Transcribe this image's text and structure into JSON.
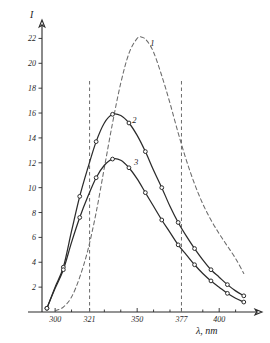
{
  "chart_data": {
    "type": "line",
    "title": "",
    "subtitle": "",
    "xlabel": "λ, nm",
    "ylabel": "I",
    "xlim": [
      292,
      420
    ],
    "ylim": [
      0,
      23
    ],
    "grid": false,
    "legend_position": "inline-curve-labels",
    "x_ticks": [
      300,
      321,
      350,
      377,
      400
    ],
    "x_tick_labels": [
      "300",
      "321",
      "350",
      "377",
      "400"
    ],
    "x_minor_ticks": [
      310,
      330,
      340,
      360,
      370,
      390,
      410
    ],
    "y_ticks": [
      2,
      4,
      6,
      8,
      10,
      12,
      14,
      16,
      18,
      20,
      22
    ],
    "y_tick_labels": [
      "2",
      "4",
      "6",
      "8",
      "10",
      "12",
      "14",
      "16",
      "18",
      "20",
      "22"
    ],
    "annotations": [
      {
        "text": "1",
        "x": 358,
        "y": 21.4,
        "curve": "1"
      },
      {
        "text": "2",
        "x": 347,
        "y": 15.2,
        "curve": "2"
      },
      {
        "text": "3",
        "x": 348,
        "y": 11.8,
        "curve": "3"
      }
    ],
    "reference_lines": [
      {
        "orientation": "vertical",
        "x": 321,
        "style": "dashed",
        "label": "321"
      },
      {
        "orientation": "vertical",
        "x": 377,
        "style": "dashed",
        "label": "377"
      }
    ],
    "series": [
      {
        "name": "1",
        "label": "1",
        "style": "dashed",
        "markers": false,
        "x": [
          300,
          305,
          310,
          315,
          320,
          325,
          330,
          335,
          340,
          345,
          350,
          353,
          356,
          360,
          365,
          370,
          375,
          380,
          385,
          390,
          395,
          400,
          405,
          410,
          415
        ],
        "values": [
          0.1,
          0.4,
          1.2,
          2.8,
          5.0,
          8.0,
          11.6,
          15.2,
          18.4,
          20.8,
          22.0,
          22.1,
          21.8,
          20.9,
          19.0,
          16.8,
          14.4,
          12.2,
          10.3,
          8.7,
          7.4,
          6.3,
          5.3,
          4.3,
          3.1
        ]
      },
      {
        "name": "2",
        "label": "2",
        "style": "solid",
        "markers": true,
        "x": [
          295,
          300,
          305,
          310,
          315,
          320,
          325,
          330,
          335,
          340,
          345,
          350,
          355,
          360,
          365,
          370,
          375,
          380,
          385,
          390,
          395,
          400,
          405,
          410,
          415
        ],
        "values": [
          0.3,
          2.0,
          3.6,
          6.5,
          9.3,
          11.6,
          13.7,
          15.2,
          15.9,
          15.8,
          15.2,
          14.2,
          12.9,
          11.4,
          10.0,
          8.5,
          7.2,
          6.1,
          5.1,
          4.2,
          3.4,
          2.8,
          2.2,
          1.7,
          1.3
        ]
      },
      {
        "name": "3",
        "label": "3",
        "style": "solid",
        "markers": true,
        "x": [
          295,
          300,
          305,
          310,
          315,
          320,
          325,
          330,
          335,
          340,
          345,
          350,
          355,
          360,
          365,
          370,
          375,
          380,
          385,
          390,
          395,
          400,
          405,
          410,
          415
        ],
        "values": [
          0.3,
          1.9,
          3.4,
          5.6,
          7.6,
          9.3,
          10.8,
          11.8,
          12.3,
          12.2,
          11.6,
          10.7,
          9.6,
          8.5,
          7.4,
          6.4,
          5.4,
          4.6,
          3.8,
          3.1,
          2.5,
          2.0,
          1.5,
          1.1,
          0.8
        ]
      }
    ]
  },
  "figure": {
    "y_axis_symbol": "I",
    "x_axis_caption": "λ, nm"
  }
}
